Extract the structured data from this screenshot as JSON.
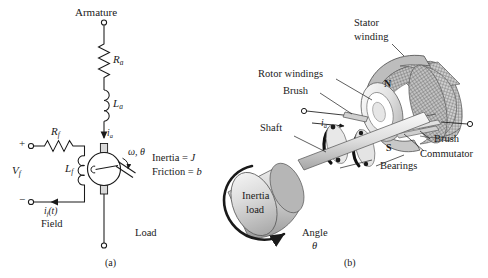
{
  "figure": {
    "caption_a": "(a)",
    "caption_b": "(b)"
  },
  "circuit": {
    "armature_label": "Armature",
    "Ra": "R",
    "Ra_sub": "a",
    "La": "L",
    "La_sub": "a",
    "ia": "i",
    "ia_sub": "a",
    "Rf": "R",
    "Rf_sub": "f",
    "Lf": "L",
    "Lf_sub": "f",
    "Vf": "V",
    "Vf_sub": "f",
    "if_label": "i",
    "if_sub": "f",
    "if_tail": "(t)",
    "field_label": "Field",
    "plus": "+",
    "minus": "−",
    "omega_theta": "ω, θ",
    "inertia": "Inertia = ",
    "inertia_sym": "J",
    "friction": "Friction = ",
    "friction_sym": "b",
    "load_label": "Load"
  },
  "motor": {
    "stator_winding": "Stator\nwinding",
    "stator_winding_l1": "Stator",
    "stator_winding_l2": "winding",
    "rotor_windings": "Rotor windings",
    "brush_left": "Brush",
    "brush_right": "Brush",
    "commutator": "Commutator",
    "shaft": "Shaft",
    "bearings": "Bearings",
    "inertia_load_l1": "Inertia",
    "inertia_load_l2": "load",
    "angle_l1": "Angle",
    "angle_l2": "θ",
    "pole_n": "N",
    "pole_s": "S",
    "ia": "i",
    "ia_sub": "a"
  },
  "colors": {
    "ink": "#1a1a1a",
    "line": "#2b2b2b",
    "metal_light": "#e3e3e3",
    "metal_mid": "#c2c2c2",
    "metal_dark": "#9a9a9a",
    "hatch": "#8c8c8c"
  }
}
